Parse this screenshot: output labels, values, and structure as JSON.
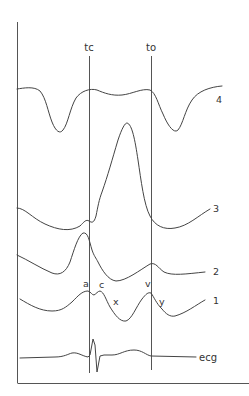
{
  "figure": {
    "markers": [
      {
        "id": "tc",
        "label": "tc",
        "x": 89
      },
      {
        "id": "to",
        "label": "to",
        "x": 151
      }
    ],
    "traces": [
      {
        "id": "4",
        "label": "4"
      },
      {
        "id": "3",
        "label": "3"
      },
      {
        "id": "2",
        "label": "2"
      },
      {
        "id": "1",
        "label": "1"
      },
      {
        "id": "ecg",
        "label": "ecg"
      }
    ],
    "wave_labels": {
      "a": "a",
      "c": "c",
      "x": "x",
      "v": "v",
      "y": "y"
    }
  },
  "colors": {
    "line": "#444444",
    "axis": "#555555",
    "text": "#333333",
    "background": "#ffffff"
  }
}
